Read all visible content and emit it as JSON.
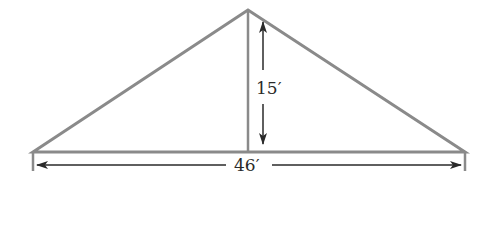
{
  "figure": {
    "type": "isosceles-triangle-dimension-diagram",
    "height_label": "15′",
    "base_label": "46′",
    "colors": {
      "edge": "#8a8a8a",
      "dimension": "#2a2a2a",
      "background": "#ffffff"
    }
  }
}
